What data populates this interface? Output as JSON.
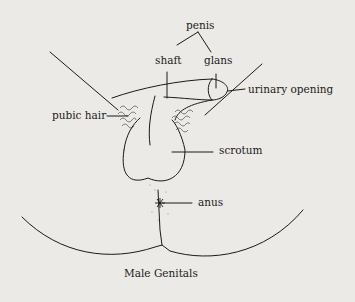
{
  "diagram": {
    "caption": "Male Genitals",
    "labels": {
      "penis": "penis",
      "shaft": "shaft",
      "glans": "glans",
      "urinary_opening": "urinary opening",
      "pubic_hair": "pubic hair",
      "scrotum": "scrotum",
      "anus": "anus"
    },
    "colors": {
      "background": "#eceae6",
      "ink": "#1a1a1a"
    }
  }
}
